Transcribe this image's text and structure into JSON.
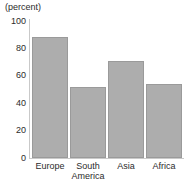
{
  "chart_data": {
    "type": "bar",
    "title": "",
    "unit_label": "(percent)",
    "xlabel": "",
    "ylabel": "",
    "categories": [
      "Europe",
      "South America",
      "Asia",
      "Africa"
    ],
    "category_lines": [
      [
        "Europe"
      ],
      [
        "South",
        "America"
      ],
      [
        "Asia"
      ],
      [
        "Africa"
      ]
    ],
    "values": [
      88,
      52,
      71,
      54
    ],
    "ylim": [
      0,
      100
    ],
    "yticks": [
      0,
      20,
      40,
      60,
      80,
      100
    ],
    "ytick_labels": [
      "0",
      "20",
      "40",
      "60",
      "80",
      "100"
    ],
    "grid": false,
    "legend": false,
    "bar_color": "#adadad",
    "bar_border_color": "#9a9a9a",
    "axis_color": "#c9c9c9",
    "text_color": "#2b2b2b"
  }
}
